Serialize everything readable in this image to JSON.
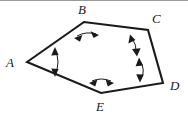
{
  "figure": {
    "kind": "geometry-diagram",
    "shape_name": "pentagon",
    "background_color": "#ffffff",
    "stroke_color": "#1a1a1a",
    "top_rule_color": "#9a9a9a",
    "vertices": [
      {
        "label": "A",
        "x": 27,
        "y": 62,
        "label_x": 6,
        "label_y": 56
      },
      {
        "label": "B",
        "x": 84,
        "y": 22,
        "label_x": 78,
        "label_y": 3
      },
      {
        "label": "C",
        "x": 148,
        "y": 30,
        "label_x": 152,
        "label_y": 12
      },
      {
        "label": "D",
        "x": 163,
        "y": 83,
        "label_x": 170,
        "label_y": 79
      },
      {
        "label": "E",
        "x": 101,
        "y": 93,
        "label_x": 96,
        "label_y": 100
      }
    ],
    "edges": [
      {
        "from": "A",
        "to": "B"
      },
      {
        "from": "B",
        "to": "C"
      },
      {
        "from": "C",
        "to": "D"
      },
      {
        "from": "D",
        "to": "E"
      },
      {
        "from": "E",
        "to": "A"
      }
    ],
    "angle_markers": [
      {
        "vertex": "A",
        "style": "double-headed-arc-arrow"
      },
      {
        "vertex": "B",
        "style": "double-headed-arc-arrow"
      },
      {
        "vertex": "C",
        "style": "double-headed-arc-arrow"
      },
      {
        "vertex": "D",
        "style": "double-headed-arc-arrow"
      },
      {
        "vertex": "E",
        "style": "double-headed-arc-arrow"
      }
    ]
  },
  "labels": {
    "a": "A",
    "b": "B",
    "c": "C",
    "d": "D",
    "e": "E"
  }
}
